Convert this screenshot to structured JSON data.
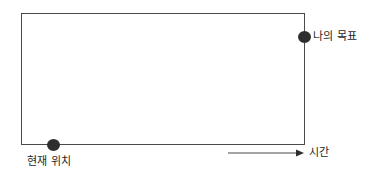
{
  "figure": {
    "background_color": "#ffffff",
    "line_color": "#4a4a4a",
    "marker_color": "#2e2e2e",
    "text_color": "#1f1f1f"
  },
  "diagram": {
    "frame": {
      "name": "gap-rectangle",
      "x": 21,
      "y": 13,
      "width": 284,
      "height": 132
    },
    "markers": [
      {
        "id": "goal",
        "label": "나의 목표",
        "cx": 305,
        "cy": 37,
        "radius": 6.5,
        "color": "#2e2e2e"
      },
      {
        "id": "current",
        "label": "현재 위치",
        "cx": 54,
        "cy": 145,
        "radius": 6.5,
        "color": "#2e2e2e"
      }
    ],
    "axis": {
      "label": "시간",
      "direction": "right",
      "x_start": 228,
      "x_end": 302,
      "y": 153
    }
  },
  "icons": {
    "goal_marker": "filled-circle-icon",
    "current_marker": "filled-circle-icon",
    "time_axis": "right-arrow-icon"
  }
}
